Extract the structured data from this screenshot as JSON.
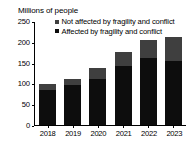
{
  "chart_data": {
    "type": "bar",
    "subtype": "stacked-bar",
    "title": "Millions of people",
    "xlabel": "",
    "ylabel": "Millions of people",
    "categories": [
      "2018",
      "2019",
      "2020",
      "2021",
      "2022",
      "2023"
    ],
    "series": [
      {
        "name": "Affected by fragility and conflict",
        "color": "#0d0d0d",
        "values": [
          84,
          96,
          110,
          142,
          161,
          154
        ]
      },
      {
        "name": "Not affected by fragility and conflict",
        "color": "#3f3f3f",
        "values": [
          14,
          15,
          27,
          34,
          43,
          57
        ]
      }
    ],
    "totals": [
      98,
      111,
      137,
      176,
      204,
      211
    ],
    "ylim": [
      0,
      250
    ],
    "yticks": [
      "0",
      "50",
      "100",
      "150",
      "200",
      "250"
    ],
    "ytick_values": [
      0,
      50,
      100,
      150,
      200,
      250
    ],
    "grid": false,
    "legend_position": "top-right",
    "stack_order": [
      "Affected by fragility and conflict",
      "Not affected by fragility and conflict"
    ]
  },
  "legend": {
    "items": [
      {
        "label": "Not affected by fragility and conflict",
        "color": "#3f3f3f",
        "marker": "square-swatch-icon"
      },
      {
        "label": "Affected by fragility and conflict",
        "color": "#0d0d0d",
        "marker": "square-swatch-icon"
      }
    ]
  },
  "axis": {
    "title": "Millions of people"
  },
  "colors": {
    "background": "#ffffff",
    "axis": "#000000",
    "text": "#000000",
    "affected": "#0d0d0d",
    "not_affected": "#3f3f3f"
  }
}
